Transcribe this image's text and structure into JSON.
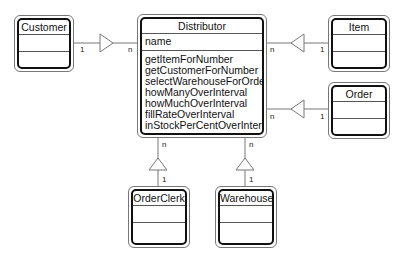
{
  "diagram": {
    "type": "UML class diagram",
    "classes": {
      "customer": {
        "name": "Customer"
      },
      "distributor": {
        "name": "Distributor",
        "attributes": [
          "name"
        ],
        "operations": [
          "getItemForNumber",
          "getCustomerForNumber",
          "selectWarehouseForOrder",
          "howManyOverInterval",
          "howMuchOverInterval",
          "fillRateOverInterval",
          "inStockPerCentOverInterval"
        ]
      },
      "item": {
        "name": "Item"
      },
      "order": {
        "name": "Order"
      },
      "orderclerk": {
        "name": "OrderClerk"
      },
      "warehouse": {
        "name": "Warehouse"
      }
    },
    "associations": {
      "customer": {
        "from_mult": "1",
        "to_mult": "n"
      },
      "item": {
        "from_mult": "1",
        "to_mult": "n"
      },
      "order": {
        "from_mult": "1",
        "to_mult": "n"
      },
      "orderclerk": {
        "from_mult": "1",
        "to_mult": "n"
      },
      "warehouse": {
        "from_mult": "1",
        "to_mult": "n"
      }
    }
  }
}
